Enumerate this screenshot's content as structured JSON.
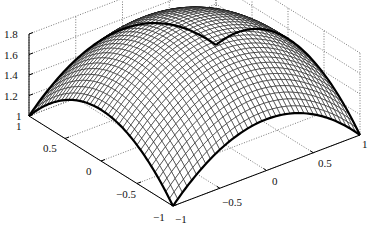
{
  "chart_data": {
    "type": "surface",
    "title": "",
    "xlabel": "",
    "ylabel": "",
    "zlabel": "",
    "function": "z = 2 - (x^2 + y^2)/2",
    "xlim": [
      -1,
      1
    ],
    "ylim": [
      -1,
      1
    ],
    "zlim": [
      1,
      1.8
    ],
    "grid": true,
    "mesh_resolution": 41,
    "x_ticks": [
      -1,
      -0.5,
      0,
      0.5,
      1
    ],
    "y_ticks": [
      -1,
      -0.5,
      0,
      0.5,
      1
    ],
    "z_ticks": [
      1,
      1.2,
      1.4,
      1.6,
      1.8
    ],
    "x_tick_labels": [
      "−1",
      "−0.5",
      "0",
      "0.5",
      "1"
    ],
    "y_tick_labels": [
      "−1",
      "−0.5",
      "0",
      "0.5",
      "1"
    ],
    "z_tick_labels": [
      "1",
      "1.2",
      "1.4",
      "1.6",
      "1.8"
    ],
    "corner_values": {
      "(-1,-1)": 1,
      "(-1,1)": 1,
      "(1,-1)": 1,
      "(1,1)": 1
    },
    "edge_midpoint_value": 1.5,
    "peak": {
      "x": 0,
      "y": 0,
      "z": 2.0
    },
    "colors": {
      "mesh": "#111111",
      "edge": "#000000",
      "grid": "#555555",
      "background": "#ffffff"
    }
  }
}
